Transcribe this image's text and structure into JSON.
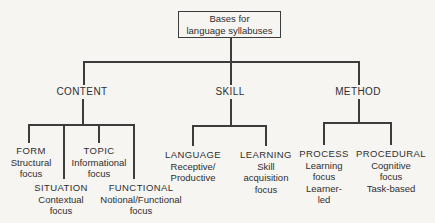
{
  "figure_title": "Bases for language syllabuses",
  "root": {
    "line1": "Bases for",
    "line2": "language syllabuses"
  },
  "branches": {
    "content": {
      "label": "CONTENT"
    },
    "skill": {
      "label": "SKILL"
    },
    "method": {
      "label": "METHOD"
    }
  },
  "leaves": {
    "form": {
      "title": "FORM",
      "lines": [
        "Structural",
        "focus"
      ]
    },
    "situation": {
      "title": "SITUATION",
      "lines": [
        "Contextual",
        "focus"
      ]
    },
    "topic": {
      "title": "TOPIC",
      "lines": [
        "Informational",
        "focus"
      ]
    },
    "functional": {
      "title": "FUNCTIONAL",
      "lines": [
        "Notional/Functional",
        "focus"
      ]
    },
    "language": {
      "title": "LANGUAGE",
      "lines": [
        "Receptive/",
        "Productive"
      ]
    },
    "learning": {
      "title": "LEARNING",
      "lines": [
        "Skill",
        "acquisition",
        "focus"
      ]
    },
    "process": {
      "title": "PROCESS",
      "lines": [
        "Learning",
        "focus",
        "Learner-",
        "led"
      ]
    },
    "procedural": {
      "title": "PROCEDURAL",
      "lines": [
        "Cognitive",
        "focus",
        "Task-based"
      ]
    }
  },
  "colors": {
    "background": "#f6f5f2",
    "line": "#3c3c3c",
    "text": "#2e2e2e"
  }
}
